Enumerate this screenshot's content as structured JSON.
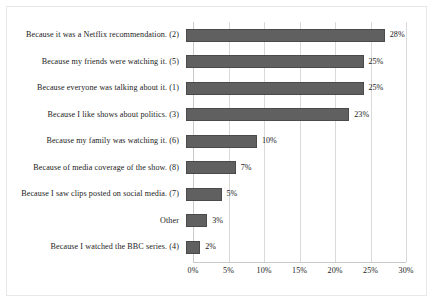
{
  "chart_data": {
    "type": "bar",
    "orientation": "horizontal",
    "title": "",
    "subtitle": "",
    "xlabel": "",
    "ylabel": "",
    "xlim": [
      0,
      30
    ],
    "xticks": [
      "0%",
      "5%",
      "10%",
      "15%",
      "20%",
      "25%",
      "30%"
    ],
    "xtick_values": [
      0,
      5,
      10,
      15,
      20,
      25,
      30
    ],
    "grid": true,
    "legend": "none",
    "bar_color": "#606060",
    "categories": [
      "Because it was a Netflix recommendation. (2)",
      "Because my friends were watching it. (5)",
      "Because everyone was talking about it. (1)",
      "Because I like shows about politics. (3)",
      "Because my family was watching it. (6)",
      "Because of media coverage of the show. (8)",
      "Because I saw clips posted on social media. (7)",
      "Other",
      "Because I watched the BBC series. (4)"
    ],
    "values": [
      28,
      25,
      25,
      23,
      10,
      7,
      5,
      3,
      2
    ],
    "data_labels": [
      "28%",
      "25%",
      "25%",
      "23%",
      "10%",
      "7%",
      "5%",
      "3%",
      "2%"
    ]
  }
}
